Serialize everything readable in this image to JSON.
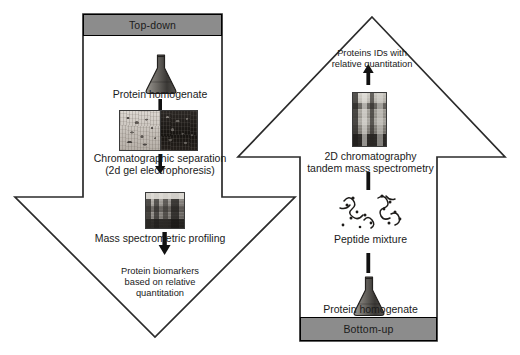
{
  "diagram": {
    "colors": {
      "band_fill": "#8c8c8c",
      "outline": "#2b2b2b",
      "panel_fill": "#ffffff",
      "text": "#1a1a1a"
    }
  },
  "left_flow": {
    "band_label": "Top-down",
    "direction": "down",
    "steps": [
      {
        "id": "protein-homogenate",
        "icon": "erlenmeyer-flask-icon",
        "label": "Protein homogenate"
      },
      {
        "id": "chromatographic-separation",
        "icon": "2d-gel-image",
        "label_line1": "Chromatographic separation",
        "label_line2": "(2d gel electrophoresis)"
      },
      {
        "id": "mass-spectrometric-profiling",
        "icon": "mass-spectrometer-photo",
        "label": "Mass spectrometric profiling"
      },
      {
        "id": "protein-biomarkers",
        "icon": "none",
        "label_line1": "Protein biomarkers",
        "label_line2": "based on relative",
        "label_line3": "quantitation"
      }
    ]
  },
  "right_flow": {
    "band_label": "Bottom-up",
    "direction": "up",
    "steps": [
      {
        "id": "proteins-ids",
        "icon": "none",
        "label_line1": "Proteins IDs with",
        "label_line2": "relative quantitation"
      },
      {
        "id": "2d-chromatography-ms-ms",
        "icon": "lc-msms-instrument-photo",
        "label_line1": "2D chromatography",
        "label_line2": "tandem mass spectrometry"
      },
      {
        "id": "peptide-mixture",
        "icon": "peptide-squiggles-icon",
        "label": "Peptide mixture"
      },
      {
        "id": "protein-homogenate-bu",
        "icon": "erlenmeyer-flask-icon",
        "label": "Protein homogenate"
      }
    ]
  }
}
